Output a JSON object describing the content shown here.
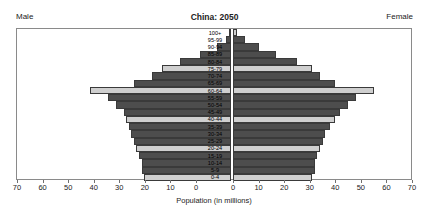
{
  "header": {
    "male_label": "Male",
    "female_label": "Female",
    "title": "China: 2050"
  },
  "axis": {
    "xlabel": "Population (in millions)",
    "ticks": [
      "70",
      "60",
      "50",
      "40",
      "30",
      "20",
      "10",
      "0",
      "0",
      "10",
      "20",
      "30",
      "40",
      "50",
      "60",
      "70"
    ],
    "max": 70
  },
  "colors": {
    "light": "#cfcfcf",
    "dark": "#4d4d4d",
    "mid": "#8c8c8c",
    "frame": "#8a8a8a"
  },
  "chart_data": {
    "type": "bar",
    "orientation": "population-pyramid",
    "title": "China: 2050",
    "xlabel": "Population (in millions)",
    "ylabel": "",
    "xlim": [
      -70,
      70
    ],
    "grid": false,
    "legend": "none",
    "categories": [
      "100+",
      "95-99",
      "90-94",
      "85-89",
      "80-84",
      "75-79",
      "70-74",
      "65-69",
      "60-64",
      "55-59",
      "50-54",
      "45-49",
      "40-44",
      "35-39",
      "30-34",
      "25-29",
      "20-24",
      "15-19",
      "10-14",
      "5-9",
      "0-4"
    ],
    "series": [
      {
        "name": "Male",
        "values": [
          0.5,
          2.0,
          5.5,
          12.0,
          20.0,
          27.0,
          31.0,
          38.0,
          55.0,
          48.0,
          45.0,
          42.0,
          41.0,
          40.0,
          39.0,
          38.0,
          37.0,
          36.0,
          35.0,
          35.0,
          34.0
        ]
      },
      {
        "name": "Female",
        "values": [
          1.5,
          4.5,
          10.0,
          17.0,
          25.0,
          31.0,
          34.0,
          40.0,
          55.0,
          48.0,
          45.0,
          42.0,
          40.0,
          38.0,
          36.0,
          35.0,
          34.0,
          33.0,
          32.0,
          32.0,
          31.0
        ]
      }
    ],
    "bar_shades": [
      "light",
      "dark",
      "dark",
      "dark",
      "dark",
      "light",
      "dark",
      "dark",
      "light",
      "dark",
      "dark",
      "dark",
      "light",
      "dark",
      "dark",
      "dark",
      "light",
      "dark",
      "dark",
      "dark",
      "light"
    ]
  }
}
